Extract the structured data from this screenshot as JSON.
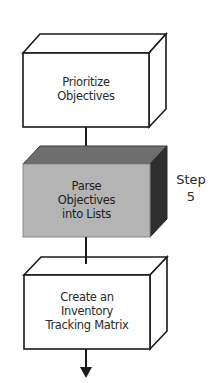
{
  "diagram": {
    "type": "flowchart",
    "boxes": [
      {
        "id": "box-1",
        "lines": [
          "Prioritize",
          "Objectives"
        ],
        "highlighted": false
      },
      {
        "id": "box-2",
        "lines": [
          "Parse",
          "Objectives",
          "into Lists"
        ],
        "highlighted": true
      },
      {
        "id": "box-3",
        "lines": [
          "Create an",
          "Inventory",
          "Tracking Matrix"
        ],
        "highlighted": false
      }
    ],
    "step_label": {
      "word": "Step",
      "number": "5"
    },
    "colors": {
      "outline": "#1a1a1a",
      "background": "#ffffff",
      "highlight_front": "#b4b4b4",
      "highlight_top": "#6e6e6e",
      "highlight_side": "#3a3a3a"
    }
  }
}
